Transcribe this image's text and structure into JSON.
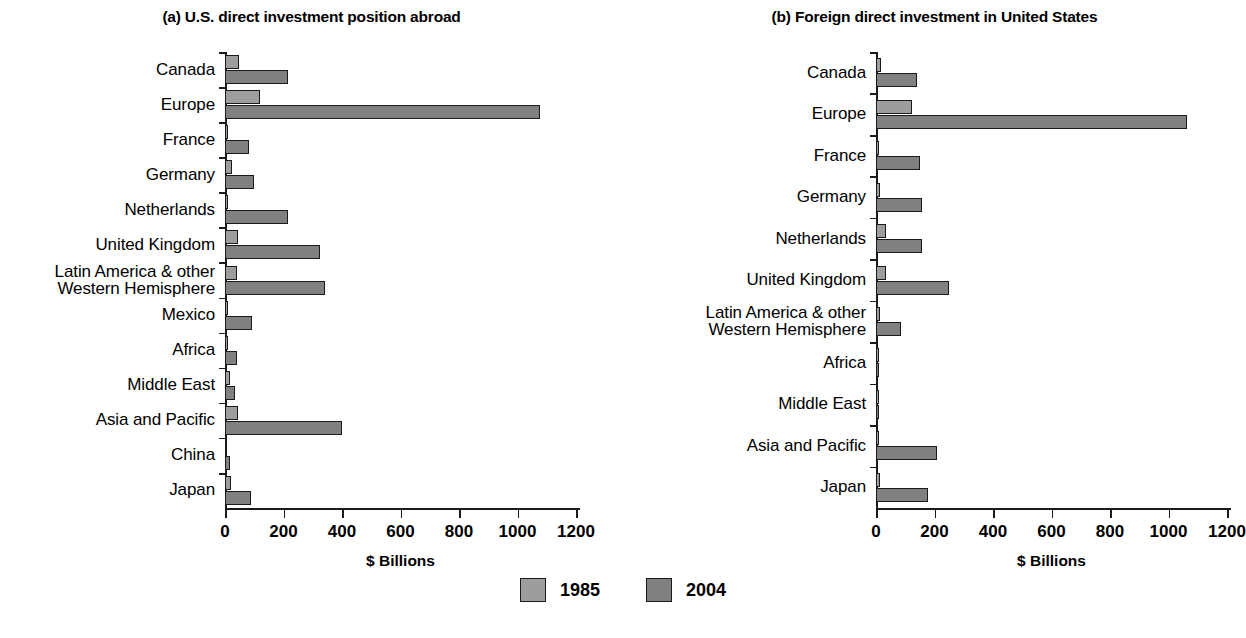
{
  "figure": {
    "panels": [
      {
        "key": "a",
        "title": "(a) U.S. direct investment position abroad",
        "xlabel": "$ Billions"
      },
      {
        "key": "b",
        "title": "(b) Foreign direct investment in United States",
        "xlabel": "$ Billions"
      }
    ],
    "legend": {
      "items": [
        {
          "label": "1985",
          "color": "#9d9d9d"
        },
        {
          "label": "2004",
          "color": "#808080"
        }
      ]
    },
    "axis": {
      "ticks": [
        "0",
        "200",
        "400",
        "600",
        "800",
        "1000",
        "1200"
      ]
    }
  },
  "chart_data": [
    {
      "type": "bar",
      "orientation": "horizontal",
      "title": "(a) U.S. direct investment position abroad",
      "xlabel": "$ Billions",
      "ylabel": "",
      "xlim": [
        0,
        1200
      ],
      "xticks": [
        0,
        200,
        400,
        600,
        800,
        1000,
        1200
      ],
      "grid": false,
      "legend_position": "bottom-center",
      "categories": [
        "Canada",
        "Europe",
        "France",
        "Germany",
        "Netherlands",
        "United Kingdom",
        "Latin America & other Western Hemisphere",
        "Mexico",
        "Africa",
        "Middle East",
        "Asia and Pacific",
        "China",
        "Japan"
      ],
      "series": [
        {
          "name": "1985",
          "color": "#9d9d9d",
          "values": [
            47,
            120,
            10,
            23,
            5,
            44,
            41,
            5,
            10,
            18,
            43,
            0,
            19
          ]
        },
        {
          "name": "2004",
          "color": "#808080",
          "values": [
            216,
            1078,
            82,
            100,
            215,
            325,
            342,
            92,
            42,
            35,
            400,
            17,
            90
          ]
        }
      ]
    },
    {
      "type": "bar",
      "orientation": "horizontal",
      "title": "(b) Foreign direct investment in United States",
      "xlabel": "$ Billions",
      "ylabel": "",
      "xlim": [
        0,
        1200
      ],
      "xticks": [
        0,
        200,
        400,
        600,
        800,
        1000,
        1200
      ],
      "grid": false,
      "legend_position": "bottom-center",
      "categories": [
        "Canada",
        "Europe",
        "France",
        "Germany",
        "Netherlands",
        "United Kingdom",
        "Latin America & other Western Hemisphere",
        "Africa",
        "Middle East",
        "Asia and Pacific",
        "Japan"
      ],
      "series": [
        {
          "name": "1985",
          "color": "#9d9d9d",
          "values": [
            17,
            123,
            10,
            14,
            35,
            33,
            12,
            2,
            7,
            3,
            15
          ]
        },
        {
          "name": "2004",
          "color": "#808080",
          "values": [
            140,
            1063,
            150,
            157,
            157,
            250,
            85,
            5,
            7,
            208,
            178
          ]
        }
      ]
    }
  ]
}
